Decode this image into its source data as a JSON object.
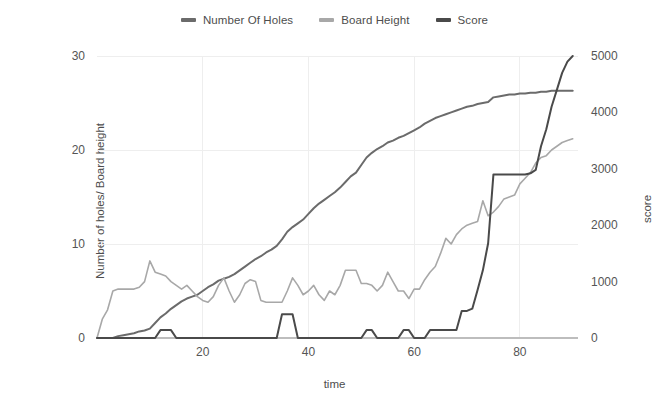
{
  "legend": {
    "position": "top-center",
    "entries": [
      {
        "label": "Number Of Holes",
        "color": "#6b6b6b",
        "icon": "line-swatch-icon"
      },
      {
        "label": "Board Height",
        "color": "#a8a8a8",
        "icon": "line-swatch-icon"
      },
      {
        "label": "Score",
        "color": "#4a4a4a",
        "icon": "line-swatch-icon"
      }
    ]
  },
  "axes": {
    "y_left_title": "Number of holes/ Board height",
    "y_right_title": "score",
    "x_title": "time",
    "y_left_ticks": [
      "0",
      "10",
      "20",
      "30"
    ],
    "y_right_ticks": [
      "0",
      "1000",
      "2000",
      "3000",
      "4000",
      "5000"
    ],
    "x_ticks": [
      "20",
      "40",
      "60",
      "80"
    ]
  },
  "chart_data": {
    "type": "line",
    "title": "",
    "subtitle": "",
    "xlabel": "time",
    "ylabel": "Number of holes/ Board height",
    "ylabel_secondary": "score",
    "xlim": [
      0,
      91
    ],
    "ylim": [
      0,
      30
    ],
    "ylim_secondary": [
      0,
      5000
    ],
    "grid": true,
    "grid_color": "#eeeeee",
    "legend_position": "top-center",
    "background": "#ffffff",
    "x_ticks": [
      20,
      40,
      60,
      80
    ],
    "y_ticks_left": [
      0,
      10,
      20,
      30
    ],
    "y_ticks_right": [
      0,
      1000,
      2000,
      3000,
      4000,
      5000
    ],
    "x": [
      0,
      1,
      2,
      3,
      4,
      5,
      6,
      7,
      8,
      9,
      10,
      11,
      12,
      13,
      14,
      15,
      16,
      17,
      18,
      19,
      20,
      21,
      22,
      23,
      24,
      25,
      26,
      27,
      28,
      29,
      30,
      31,
      32,
      33,
      34,
      35,
      36,
      37,
      38,
      39,
      40,
      41,
      42,
      43,
      44,
      45,
      46,
      47,
      48,
      49,
      50,
      51,
      52,
      53,
      54,
      55,
      56,
      57,
      58,
      59,
      60,
      61,
      62,
      63,
      64,
      65,
      66,
      67,
      68,
      69,
      70,
      71,
      72,
      73,
      74,
      75,
      76,
      77,
      78,
      79,
      80,
      81,
      82,
      83,
      84,
      85,
      86,
      87,
      88,
      89,
      90
    ],
    "series": [
      {
        "name": "Number Of Holes",
        "axis": "left",
        "color": "#6b6b6b",
        "width": 2.0,
        "values": [
          0,
          0,
          0,
          0,
          0.2,
          0.3,
          0.4,
          0.5,
          0.7,
          0.8,
          1.0,
          1.6,
          2.2,
          2.6,
          3.1,
          3.5,
          3.9,
          4.2,
          4.4,
          4.6,
          5.0,
          5.4,
          5.7,
          6.1,
          6.3,
          6.5,
          6.8,
          7.2,
          7.6,
          8.0,
          8.4,
          8.7,
          9.1,
          9.4,
          9.8,
          10.5,
          11.3,
          11.8,
          12.2,
          12.6,
          13.2,
          13.8,
          14.3,
          14.7,
          15.1,
          15.5,
          16.0,
          16.6,
          17.2,
          17.6,
          18.4,
          19.2,
          19.7,
          20.1,
          20.4,
          20.8,
          21.0,
          21.3,
          21.5,
          21.8,
          22.1,
          22.4,
          22.8,
          23.1,
          23.4,
          23.6,
          23.8,
          24.0,
          24.2,
          24.4,
          24.6,
          24.7,
          24.9,
          25.0,
          25.1,
          25.6,
          25.7,
          25.8,
          25.9,
          25.9,
          26.0,
          26.0,
          26.1,
          26.1,
          26.2,
          26.2,
          26.3,
          26.3,
          26.3,
          26.3,
          26.3
        ]
      },
      {
        "name": "Board Height",
        "axis": "left",
        "color": "#a8a8a8",
        "width": 1.6,
        "values": [
          0,
          2.0,
          3.0,
          5.0,
          5.2,
          5.2,
          5.2,
          5.2,
          5.4,
          6.0,
          8.2,
          7.0,
          6.8,
          6.6,
          6.0,
          5.6,
          5.2,
          5.6,
          5.0,
          4.4,
          4.0,
          3.8,
          4.4,
          5.6,
          6.4,
          5.0,
          3.8,
          4.6,
          5.8,
          6.2,
          6.0,
          4.0,
          3.8,
          3.8,
          3.8,
          3.8,
          5.0,
          6.4,
          5.6,
          4.6,
          5.0,
          5.6,
          4.6,
          4.0,
          5.0,
          4.6,
          5.6,
          7.2,
          7.2,
          7.2,
          5.8,
          5.8,
          5.6,
          5.0,
          5.6,
          7.0,
          6.0,
          5.0,
          5.0,
          4.2,
          5.2,
          5.2,
          6.2,
          7.0,
          7.6,
          9.0,
          10.6,
          10.0,
          11.0,
          11.6,
          12.0,
          12.2,
          12.4,
          14.6,
          13.0,
          13.4,
          14.0,
          14.8,
          15.0,
          15.2,
          16.4,
          17.0,
          17.6,
          18.6,
          19.2,
          19.4,
          20.0,
          20.4,
          20.8,
          21.0,
          21.2
        ]
      },
      {
        "name": "Score",
        "axis": "right",
        "color": "#4a4a4a",
        "width": 2.0,
        "values": [
          0,
          0,
          0,
          0,
          0,
          0,
          0,
          0,
          0,
          0,
          0,
          0,
          140,
          140,
          140,
          0,
          0,
          0,
          0,
          0,
          0,
          0,
          0,
          0,
          0,
          0,
          0,
          0,
          0,
          0,
          0,
          0,
          0,
          0,
          0,
          420,
          420,
          420,
          0,
          0,
          0,
          0,
          0,
          0,
          0,
          0,
          0,
          0,
          0,
          0,
          0,
          140,
          140,
          0,
          0,
          0,
          0,
          0,
          140,
          140,
          0,
          0,
          0,
          140,
          140,
          140,
          140,
          140,
          140,
          480,
          480,
          520,
          850,
          1200,
          1680,
          2900,
          2900,
          2900,
          2900,
          2900,
          2900,
          2900,
          2920,
          2980,
          3400,
          3700,
          4100,
          4400,
          4700,
          4900,
          5000
        ]
      }
    ]
  }
}
